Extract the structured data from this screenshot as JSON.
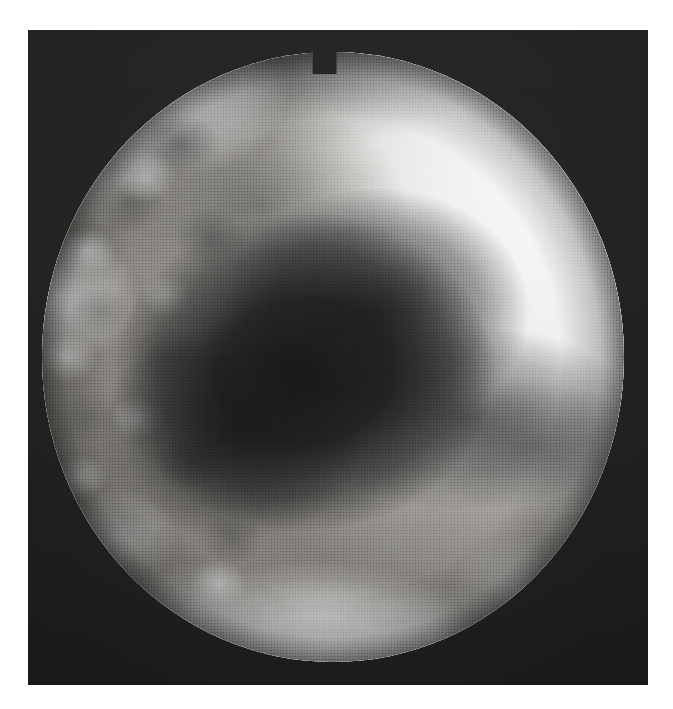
{
  "figure": {
    "kind": "grayscale-medical-image",
    "modality_appearance": "halftone-printed radiographic / endoscopic still",
    "caption": "",
    "label": "",
    "visible_text": "",
    "page_background_color": "#ffffff",
    "plate": {
      "name": "photographic-plate",
      "background_color": "#1d1c1b",
      "left": 28,
      "top": 30,
      "width": 620,
      "height": 655
    },
    "field_of_view": {
      "name": "circular-field-of-view",
      "shape": "circle",
      "center_x": 333,
      "center_y": 357,
      "radius": 291,
      "notch": {
        "present": true,
        "position": "top",
        "center_x": 337,
        "width": 24,
        "depth": 22
      }
    },
    "regions": [
      {
        "name": "bright-right-limb",
        "description": "large smooth very bright region occupying the right third of the field",
        "tone": "white",
        "hex": "#fbfbfa"
      },
      {
        "name": "dark-central-mass",
        "description": "large irregular near-black mass occupying the centre of the field, tapering toward the lower right",
        "tone": "near-black",
        "hex": "#0c0c0c"
      },
      {
        "name": "mottled-left-field",
        "description": "coarse nodular light-and-dark mottling along the left hemifield",
        "tone": "mid-grey",
        "hex": "#a9a6a1"
      },
      {
        "name": "bright-basal-cloud",
        "description": "confluent very bright cloud-like nodular opacities along the inferior margin",
        "tone": "white",
        "hex": "#ffffff"
      },
      {
        "name": "superior-grey-band",
        "description": "broad mid-grey band sweeping across the upper field toward the notch",
        "tone": "grey",
        "hex": "#6e6e6e"
      },
      {
        "name": "peripheral-vignette",
        "description": "circumferential darkening at the edge of the circular field",
        "tone": "dark",
        "hex": "#201f1e"
      }
    ],
    "palette": {
      "page": "#ffffff",
      "plate_dark": "#1d1c1b",
      "darkest": "#080808",
      "mid_grey": "#8e8e8e",
      "light_grey": "#d8d6d2",
      "brightest": "#ffffff"
    }
  }
}
